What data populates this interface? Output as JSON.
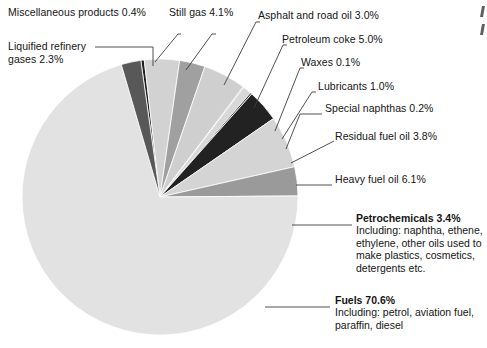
{
  "chart_data": {
    "type": "pie",
    "title": "",
    "total_label": "100%",
    "legend_position": "callout-labels",
    "center": {
      "x": 160,
      "y": 197
    },
    "radius": 138,
    "start_angle_deg": -8,
    "categories": [
      "Miscellaneous products",
      "Still gas",
      "Asphalt and road oil",
      "Petroleum coke",
      "Waxes",
      "Lubricants",
      "Special naphthas",
      "Residual fuel oil",
      "Heavy fuel oil",
      "Petrochemicals",
      "Fuels",
      "Liquified refinery gases"
    ],
    "values": [
      0.4,
      4.1,
      3.0,
      5.0,
      0.1,
      1.0,
      0.2,
      3.8,
      6.1,
      3.4,
      70.6,
      2.3
    ],
    "value_labels": [
      "0.4%",
      "4.1%",
      "3.0%",
      "5.0%",
      "0.1%",
      "1.0%",
      "0.2%",
      "3.8%",
      "6.1%",
      "3.4%",
      "70.6%",
      "2.3%"
    ],
    "colors": [
      "#1f1f1f",
      "#d2d2d2",
      "#a0a0a0",
      "#cfcfcf",
      "#8f8f8f",
      "#d8d8d8",
      "#3a3a3a",
      "#222222",
      "#d4d4d4",
      "#9a9a9a",
      "#e2e2e2",
      "#585858"
    ],
    "slice_edge_color": "#ffffff",
    "leader_line_color": "#3c3c3c"
  },
  "labels": {
    "misc": {
      "text": "Miscellaneous products 0.4%"
    },
    "lrg": {
      "line1": "Liquified refinery",
      "line2": "gases 2.3%"
    },
    "still_gas": {
      "text": "Still gas 4.1%"
    },
    "asphalt": {
      "text": "Asphalt and road oil 3.0%"
    },
    "coke": {
      "text": "Petroleum coke 5.0%"
    },
    "waxes": {
      "text": "Waxes 0.1%"
    },
    "lubricants": {
      "text": "Lubricants 1.0%"
    },
    "naphthas": {
      "text": "Special naphthas 0.2%"
    },
    "residual": {
      "text": "Residual fuel oil 3.8%"
    },
    "heavy": {
      "text": "Heavy fuel oil 6.1%"
    }
  },
  "callouts": {
    "petrochemicals": {
      "heading": "Petrochemicals 3.4%",
      "body": "Including: naphtha, ethene, ethylene, other oils used to make plastics, cosmetics, detergents etc."
    },
    "fuels": {
      "heading": "Fuels 70.6%",
      "body": "Including: petrol, aviation fuel, paraffin, diesel"
    }
  },
  "page_edge": {
    "clipped_marks": 2
  }
}
